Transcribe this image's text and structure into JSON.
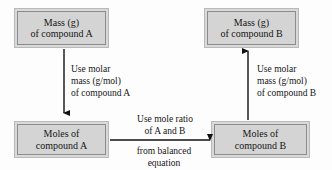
{
  "diagram": {
    "type": "flowchart",
    "background_color": "#fdfdfd",
    "box_fill_color": "#d4d4d4",
    "box_border_color": "#8c8c8c",
    "arrow_color": "#111111",
    "text_color": "#161616",
    "nodes": [
      {
        "id": "mass-a",
        "line1": "Mass (g)",
        "line2": "of compound A"
      },
      {
        "id": "moles-a",
        "line1": "Moles of",
        "line2": "compound A"
      },
      {
        "id": "mass-b",
        "line1": "Mass (g)",
        "line2": "of compound B"
      },
      {
        "id": "moles-b",
        "line1": "Moles of",
        "line2": "compound B"
      }
    ],
    "edges": [
      {
        "id": "mass-a-to-moles-a",
        "direction": "down",
        "line1": "Use molar",
        "line2": "mass (g/mol)",
        "line3": "of compound A"
      },
      {
        "id": "moles-a-to-moles-b",
        "direction": "right",
        "above_line1": "Use mole ratio",
        "above_line2": "of A and B",
        "below_line1": "from balanced",
        "below_line2": "equation"
      },
      {
        "id": "moles-b-to-mass-b",
        "direction": "up",
        "line1": "Use molar",
        "line2": "mass (g/mol)",
        "line3": "of compound B"
      }
    ]
  }
}
